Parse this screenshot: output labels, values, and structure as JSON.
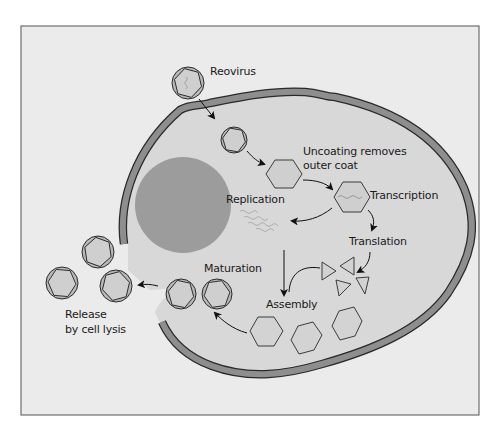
{
  "diagram": {
    "labels": {
      "reovirus": "Reovirus",
      "uncoating_line1": "Uncoating removes",
      "uncoating_line2": "outer coat",
      "transcription": "Transcription",
      "replication": "Replication",
      "translation": "Translation",
      "assembly": "Assembly",
      "maturation": "Maturation",
      "release_line1": "Release",
      "release_line2": "by cell lysis"
    },
    "stages": [
      {
        "id": "entry",
        "label": "Reovirus"
      },
      {
        "id": "uncoating",
        "label": "Uncoating removes outer coat"
      },
      {
        "id": "transcription",
        "label": "Transcription"
      },
      {
        "id": "replication",
        "label": "Replication"
      },
      {
        "id": "translation",
        "label": "Translation"
      },
      {
        "id": "assembly",
        "label": "Assembly"
      },
      {
        "id": "maturation",
        "label": "Maturation"
      },
      {
        "id": "release",
        "label": "Release by cell lysis"
      }
    ],
    "colors": {
      "frame_bg": "#ebebeb",
      "frame_border": "#6e6e6e",
      "cell_interior": "#d8d8d8",
      "membrane": "#8e8e8e",
      "nucleus": "#9c9c9c",
      "virus_coat": "#b5b5b5",
      "virus_core": "#cfcfcf",
      "outline": "#2a2a2a"
    }
  }
}
